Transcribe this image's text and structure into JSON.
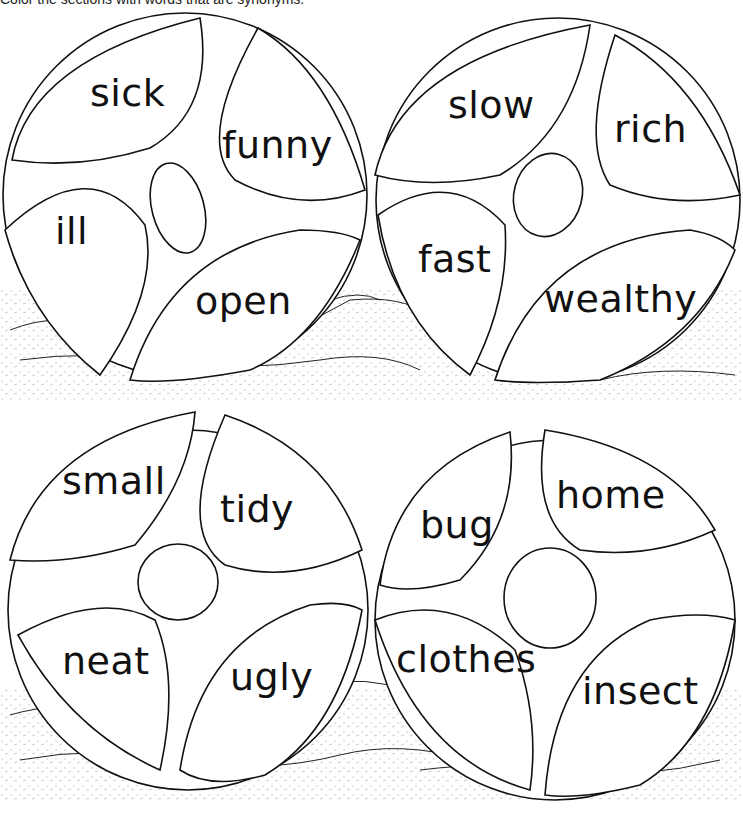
{
  "instruction": "Color the sections with words that are synonyms.",
  "balls": [
    {
      "id": "ball-1",
      "sections": [
        {
          "position": "top-left",
          "word": "sick"
        },
        {
          "position": "top-right",
          "word": "funny"
        },
        {
          "position": "bottom-left",
          "word": "ill"
        },
        {
          "position": "bottom-right",
          "word": "open"
        }
      ]
    },
    {
      "id": "ball-2",
      "sections": [
        {
          "position": "top-left",
          "word": "slow"
        },
        {
          "position": "top-right",
          "word": "rich"
        },
        {
          "position": "bottom-left",
          "word": "fast"
        },
        {
          "position": "bottom-right",
          "word": "wealthy"
        }
      ]
    },
    {
      "id": "ball-3",
      "sections": [
        {
          "position": "top-left",
          "word": "small"
        },
        {
          "position": "top-right",
          "word": "tidy"
        },
        {
          "position": "bottom-left",
          "word": "neat"
        },
        {
          "position": "bottom-right",
          "word": "ugly"
        }
      ]
    },
    {
      "id": "ball-4",
      "sections": [
        {
          "position": "top-left",
          "word": "bug"
        },
        {
          "position": "top-right",
          "word": "home"
        },
        {
          "position": "bottom-left",
          "word": "clothes"
        },
        {
          "position": "bottom-right",
          "word": "insect"
        }
      ]
    }
  ],
  "colors": {
    "ink": "#111111",
    "paper": "#ffffff"
  }
}
